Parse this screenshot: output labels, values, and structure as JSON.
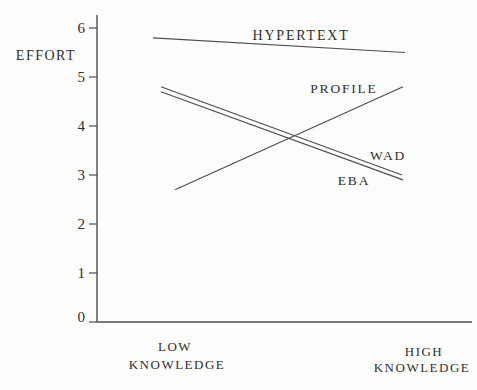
{
  "colors": {
    "line": "#4e4e4e",
    "text": "#2f2f2f",
    "background": "#fdfdfc"
  },
  "chart_data": {
    "type": "line",
    "title": "",
    "xlabel": "",
    "ylabel": "EFFORT",
    "ylim": [
      0,
      6
    ],
    "y_ticks": [
      0,
      1,
      2,
      3,
      4,
      5,
      6
    ],
    "grid": false,
    "legend": "inline-labels",
    "categories": [
      "LOW KNOWLEDGE",
      "HIGH KNOWLEDGE"
    ],
    "x_labels": [
      {
        "line1": "LOW",
        "line2": "KNOWLEDGE"
      },
      {
        "line1": "HIGH",
        "line2": "KNOWLEDGE"
      }
    ],
    "series": [
      {
        "name": "HYPERTEXT",
        "values": [
          5.8,
          5.5
        ]
      },
      {
        "name": "PROFILE",
        "values": [
          2.7,
          4.8
        ]
      },
      {
        "name": "WAD",
        "values": [
          4.8,
          3.0
        ]
      },
      {
        "name": "EBA",
        "values": [
          4.7,
          2.9
        ]
      }
    ]
  }
}
